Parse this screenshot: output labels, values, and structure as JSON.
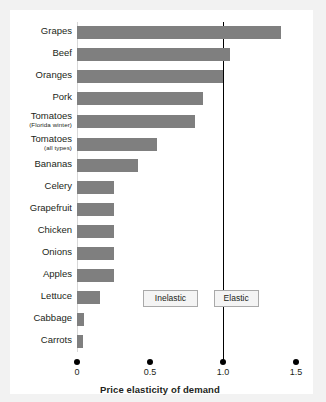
{
  "chart_data": {
    "type": "bar",
    "orientation": "horizontal",
    "title": "",
    "xlabel": "Price elasticity of demand",
    "ylabel": "",
    "xlim": [
      0,
      1.55
    ],
    "xticks": [
      "0",
      "0.5",
      "1.0",
      "1.5"
    ],
    "xtick_values": [
      0,
      0.5,
      1.0,
      1.5
    ],
    "grid": false,
    "legend": "none",
    "bar_color": "#7f7f7f",
    "reference_line": {
      "value": 1.0,
      "color": "#000000",
      "label": "unit elasticity"
    },
    "categories": [
      "Grapes",
      "Beef",
      "Oranges",
      "Pork",
      "Tomatoes",
      "Tomatoes",
      "Bananas",
      "Celery",
      "Grapefruit",
      "Chicken",
      "Onions",
      "Apples",
      "Lettuce",
      "Cabbage",
      "Carrots"
    ],
    "category_sublabels": [
      "",
      "",
      "",
      "",
      "(Florida winter)",
      "(all types)",
      "",
      "",
      "",
      "",
      "",
      "",
      "",
      "",
      ""
    ],
    "values": [
      1.4,
      1.05,
      1.0,
      0.86,
      0.81,
      0.55,
      0.42,
      0.25,
      0.25,
      0.25,
      0.25,
      0.25,
      0.16,
      0.05,
      0.04
    ],
    "annotations": [
      {
        "text": "Inelastic",
        "x_center": 0.64
      },
      {
        "text": "Elastic",
        "x_center": 1.09
      }
    ]
  }
}
